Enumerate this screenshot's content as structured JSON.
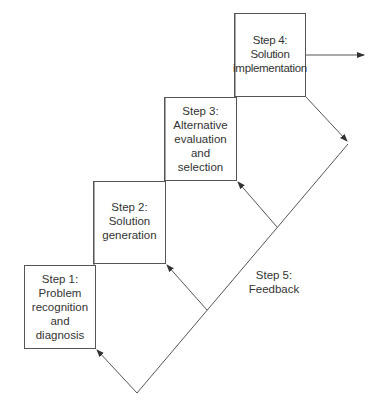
{
  "diagram": {
    "type": "staircase-process",
    "steps": [
      {
        "id": "step1",
        "title": "Step 1:",
        "lines": [
          "Step 1:",
          "Problem",
          "recognition",
          "and",
          "diagnosis"
        ]
      },
      {
        "id": "step2",
        "title": "Step 2:",
        "lines": [
          "Step 2:",
          "Solution",
          "generation"
        ]
      },
      {
        "id": "step3",
        "title": "Step 3:",
        "lines": [
          "Step 3:",
          "Alternative",
          "evaluation",
          "and",
          "selection"
        ]
      },
      {
        "id": "step4",
        "title": "Step 4:",
        "lines": [
          "Step 4:",
          "Solution",
          "implementation"
        ]
      }
    ],
    "feedback": {
      "lines": [
        "Step 5:",
        "Feedback"
      ]
    },
    "colors": {
      "line": "#444444",
      "text": "#333333",
      "background": "#ffffff"
    }
  }
}
